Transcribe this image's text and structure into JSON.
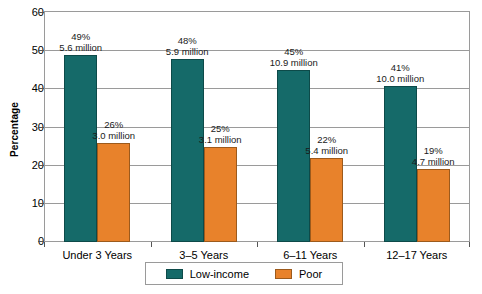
{
  "chart_data": {
    "type": "bar",
    "title": "",
    "xlabel": "",
    "ylabel": "Percentage",
    "categories": [
      "Under 3 Years",
      "3–5 Years",
      "6–11 Years",
      "12–17 Years"
    ],
    "ylim": [
      0,
      60
    ],
    "yticks": [
      0,
      10,
      20,
      30,
      40,
      50,
      60
    ],
    "grid": true,
    "legend_position": "bottom",
    "series": [
      {
        "name": "Low-income",
        "color": "#156a69",
        "values": [
          49,
          48,
          45,
          41
        ],
        "labels": [
          {
            "pct": "49%",
            "count": "5.6 million"
          },
          {
            "pct": "48%",
            "count": "5.9 million"
          },
          {
            "pct": "45%",
            "count": "10.9 million"
          },
          {
            "pct": "41%",
            "count": "10.0 million"
          }
        ]
      },
      {
        "name": "Poor",
        "color": "#e8822b",
        "values": [
          26,
          25,
          22,
          19
        ],
        "labels": [
          {
            "pct": "26%",
            "count": "3.0 million"
          },
          {
            "pct": "25%",
            "count": "3.1 million"
          },
          {
            "pct": "22%",
            "count": "5.4 million"
          },
          {
            "pct": "19%",
            "count": "4.7 million"
          }
        ]
      }
    ]
  },
  "axis": {
    "y_title": "Percentage",
    "y_tick_labels": [
      "60",
      "50",
      "40",
      "30",
      "20",
      "10",
      "0"
    ],
    "x_tick_labels": [
      "Under 3 Years",
      "3–5 Years",
      "6–11 Years",
      "12–17 Years"
    ]
  },
  "legend": {
    "entries": [
      {
        "label": "Low-income",
        "color": "#156a69"
      },
      {
        "label": "Poor",
        "color": "#e8822b"
      }
    ]
  }
}
